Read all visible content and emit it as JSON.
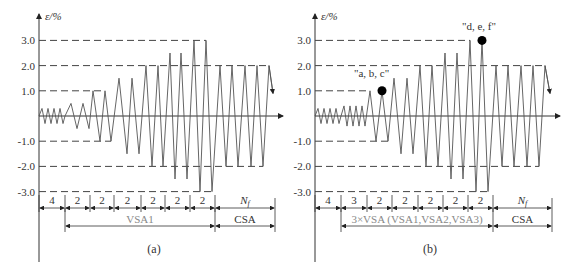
{
  "figure": {
    "y_axis_label": "ε/%",
    "y_ticks": [
      {
        "value": 3.0,
        "label": "3.0"
      },
      {
        "value": 2.0,
        "label": "2.0"
      },
      {
        "value": 1.0,
        "label": "1.0"
      },
      {
        "value": -1.0,
        "label": "-1.0"
      },
      {
        "value": -2.0,
        "label": "-2.0"
      },
      {
        "value": -3.0,
        "label": "-3.0"
      }
    ],
    "colors": {
      "line": "#555555",
      "axis": "#333333",
      "dash": "#444444",
      "marker": "#000000"
    }
  },
  "panels": [
    {
      "id": "a",
      "caption": "(a)",
      "origin_x": 39,
      "segments": [
        {
          "label": "4",
          "x0": 39,
          "x1": 65
        },
        {
          "label": "2",
          "x0": 65,
          "x1": 90
        },
        {
          "label": "2",
          "x0": 90,
          "x1": 114
        },
        {
          "label": "2",
          "x0": 114,
          "x1": 141
        },
        {
          "label": "2",
          "x0": 141,
          "x1": 165
        },
        {
          "label": "2",
          "x0": 165,
          "x1": 190
        },
        {
          "label": "2",
          "x0": 190,
          "x1": 215
        },
        {
          "label": "N_f",
          "x0": 215,
          "x1": 275
        }
      ],
      "groups": [
        {
          "label": "VSA1",
          "x0": 65,
          "x1": 215,
          "gray": true
        },
        {
          "label": "CSA",
          "x0": 215,
          "x1": 275,
          "gray": false
        }
      ],
      "peaks": [
        [
          39,
          0
        ],
        [
          42,
          0.3
        ],
        [
          45,
          -0.3
        ],
        [
          48,
          0.3
        ],
        [
          51,
          -0.3
        ],
        [
          54,
          0.3
        ],
        [
          57,
          -0.3
        ],
        [
          60,
          0.3
        ],
        [
          63,
          -0.3
        ],
        [
          65,
          0
        ],
        [
          71,
          0.5
        ],
        [
          77,
          -0.5
        ],
        [
          83,
          0.5
        ],
        [
          89,
          -0.5
        ],
        [
          93,
          1.0
        ],
        [
          100,
          -1.0
        ],
        [
          105,
          1.0
        ],
        [
          111,
          -1.0
        ],
        [
          119,
          1.5
        ],
        [
          127,
          -1.5
        ],
        [
          132,
          1.5
        ],
        [
          139,
          -1.5
        ],
        [
          146,
          2.0
        ],
        [
          152,
          -2.0
        ],
        [
          158,
          2.0
        ],
        [
          163,
          -2.0
        ],
        [
          170,
          2.5
        ],
        [
          175,
          -2.5
        ],
        [
          181,
          2.5
        ],
        [
          187,
          -2.5
        ],
        [
          194,
          3.0
        ],
        [
          200,
          -3.0
        ],
        [
          206,
          3.0
        ],
        [
          212,
          -3.0
        ],
        [
          220,
          2.0
        ],
        [
          226,
          -2.0
        ],
        [
          232,
          2.0
        ],
        [
          238,
          -2.0
        ],
        [
          245,
          2.0
        ],
        [
          251,
          -2.0
        ],
        [
          257,
          2.0
        ],
        [
          263,
          -2.0
        ],
        [
          269,
          2.0
        ],
        [
          273,
          0.9
        ]
      ],
      "dash_steps": [
        {
          "level": 1.0,
          "x_end": 93,
          "x_end2": 105
        },
        {
          "level": -1.0,
          "x_end": 100,
          "x_end2": 111
        },
        {
          "level": 3.0,
          "x_end": 194,
          "x_end2": 206
        },
        {
          "level": -3.0,
          "x_end": 200,
          "x_end2": 212
        },
        {
          "level": 2.0,
          "x_end": 269,
          "x_end2": 269
        },
        {
          "level": -2.0,
          "x_end": 263,
          "x_end2": 263
        }
      ],
      "markers": []
    },
    {
      "id": "b",
      "caption": "(b)",
      "origin_x": 315,
      "segments": [
        {
          "label": "4",
          "x0": 315,
          "x1": 341
        },
        {
          "label": "3",
          "x0": 341,
          "x1": 367
        },
        {
          "label": "2",
          "x0": 367,
          "x1": 392
        },
        {
          "label": "2",
          "x0": 392,
          "x1": 418
        },
        {
          "label": "2",
          "x0": 418,
          "x1": 443
        },
        {
          "label": "2",
          "x0": 443,
          "x1": 468
        },
        {
          "label": "2",
          "x0": 468,
          "x1": 493
        },
        {
          "label": "N_f",
          "x0": 493,
          "x1": 552
        }
      ],
      "groups": [
        {
          "label": "3×VSA (VSA1,VSA2,VSA3)",
          "x0": 341,
          "x1": 493,
          "gray": true
        },
        {
          "label": "CSA",
          "x0": 493,
          "x1": 552,
          "gray": false
        }
      ],
      "peaks": [
        [
          315,
          0
        ],
        [
          318,
          0.3
        ],
        [
          321,
          -0.3
        ],
        [
          324,
          0.3
        ],
        [
          327,
          -0.3
        ],
        [
          330,
          0.3
        ],
        [
          333,
          -0.3
        ],
        [
          336,
          0.3
        ],
        [
          339,
          -0.3
        ],
        [
          341,
          0
        ],
        [
          344,
          0.4
        ],
        [
          347,
          -0.4
        ],
        [
          350,
          0.4
        ],
        [
          353,
          -0.4
        ],
        [
          356,
          0.4
        ],
        [
          359,
          -0.4
        ],
        [
          362,
          0.4
        ],
        [
          365,
          -0.4
        ],
        [
          370,
          1.0
        ],
        [
          376,
          -1.0
        ],
        [
          382,
          1.0
        ],
        [
          388,
          -1.0
        ],
        [
          394,
          1.5
        ],
        [
          401,
          -1.5
        ],
        [
          407,
          1.5
        ],
        [
          413,
          -1.5
        ],
        [
          420,
          2.0
        ],
        [
          426,
          -2.0
        ],
        [
          432,
          2.0
        ],
        [
          438,
          -2.0
        ],
        [
          445,
          2.5
        ],
        [
          451,
          -2.5
        ],
        [
          457,
          2.5
        ],
        [
          463,
          -2.5
        ],
        [
          470,
          3.0
        ],
        [
          476,
          -3.0
        ],
        [
          482,
          3.0
        ],
        [
          488,
          -3.0
        ],
        [
          496,
          2.0
        ],
        [
          502,
          -2.0
        ],
        [
          508,
          2.0
        ],
        [
          514,
          -2.0
        ],
        [
          521,
          2.0
        ],
        [
          527,
          -2.0
        ],
        [
          533,
          2.0
        ],
        [
          539,
          -2.0
        ],
        [
          545,
          2.0
        ],
        [
          550,
          0.9
        ]
      ],
      "dash_steps": [
        {
          "level": 1.0,
          "x_end": 370,
          "x_end2": 370
        },
        {
          "level": -1.0,
          "x_end": 376,
          "x_end2": 388
        },
        {
          "level": 3.0,
          "x_end": 470,
          "x_end2": 470
        },
        {
          "level": -3.0,
          "x_end": 476,
          "x_end2": 488
        },
        {
          "level": 2.0,
          "x_end": 545,
          "x_end2": 545
        },
        {
          "level": -2.0,
          "x_end": 539,
          "x_end2": 539
        }
      ],
      "markers": [
        {
          "label": "\"a, b, c\"",
          "x": 382,
          "level": 1.0,
          "label_x": 354,
          "label_y": 77
        },
        {
          "label": "\"d, e, f\"",
          "x": 482,
          "level": 3.0,
          "label_x": 462,
          "label_y": 30
        }
      ]
    }
  ]
}
